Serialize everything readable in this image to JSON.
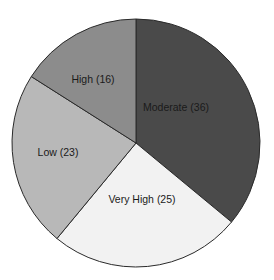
{
  "chart_data": {
    "type": "pie",
    "title": "",
    "start_angle_deg": 0,
    "direction": "clockwise",
    "center": [
      136,
      143
    ],
    "radius": 124,
    "slices": [
      {
        "label": "Moderate",
        "value": 36,
        "display": "Moderate (36)",
        "color": "#4a4a4a",
        "label_pos": [
          176,
          108
        ]
      },
      {
        "label": "Very High",
        "value": 25,
        "display": "Very High (25)",
        "color": "#f2f2f2",
        "label_pos": [
          142,
          200
        ]
      },
      {
        "label": "Low",
        "value": 23,
        "display": "Low (23)",
        "color": "#b8b8b8",
        "label_pos": [
          58,
          153
        ]
      },
      {
        "label": "High",
        "value": 16,
        "display": "High (16)",
        "color": "#8c8c8c",
        "label_pos": [
          93,
          80
        ]
      }
    ],
    "categories": [
      "Moderate",
      "Very High",
      "Low",
      "High"
    ],
    "values": [
      36,
      25,
      23,
      16
    ],
    "legend": "none (labels inside slices)"
  }
}
